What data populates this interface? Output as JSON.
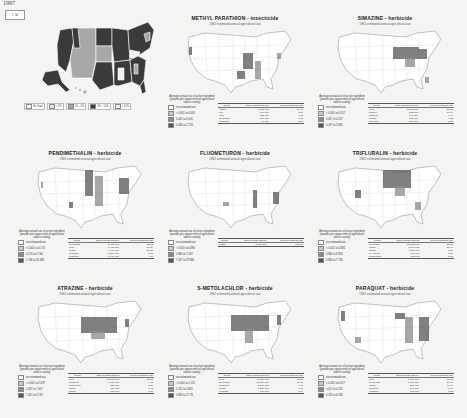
{
  "overview": {
    "year": "1997",
    "year_widget": "𝑓 ☑",
    "legend": [
      {
        "label": "No Data",
        "color": "#ffffff"
      },
      {
        "label": "< 1%",
        "color": "#e6e6e6"
      },
      {
        "label": "1% - 5%",
        "color": "#a8a8a8"
      },
      {
        "label": "5% - 10%",
        "color": "#3a3a3a"
      },
      {
        "label": "> 10%",
        "color": "#f0f0f0"
      }
    ]
  },
  "panels": [
    {
      "title": "METHYL PARATHION - insecticide",
      "subtitle": "1992 estimated annual agricultural use",
      "legend_title": "Average annual use of active ingredient (pounds per square mile of agricultural land in county)",
      "legend_items": [
        "no estimated use",
        "< 0.001 to 0.005",
        "0.005 to 0.056",
        "0.056 to 2.718"
      ],
      "table_headers": [
        "Crops",
        "Total pounds applied",
        "Percent national use"
      ],
      "table_rows": [
        [
          "cotton",
          "1,706,000",
          "69.90"
        ],
        [
          "rice",
          "197,000",
          "8.07"
        ],
        [
          "corn",
          "152,000",
          "6.23"
        ],
        [
          "soybeans",
          "124,000",
          "5.08"
        ],
        [
          "sorghum",
          "93,000",
          "3.81"
        ]
      ]
    },
    {
      "title": "SIMAZINE - herbicide",
      "subtitle": "1992 estimated annual agricultural use",
      "legend_title": "Average annual use of active ingredient (pounds per square mile of agricultural land in county)",
      "legend_items": [
        "no estimated use",
        "< 0.001 to 0.057",
        "0.057 to 0.197",
        "0.197 to 3.985"
      ],
      "table_headers": [
        "Crops",
        "Total pounds applied",
        "Percent national use"
      ],
      "table_rows": [
        [
          "corn",
          "2,650,000",
          "56.88"
        ],
        [
          "grapes",
          "512,000",
          "10.99"
        ],
        [
          "oranges",
          "440,000",
          "9.44"
        ],
        [
          "apples",
          "178,000",
          "3.82"
        ],
        [
          "almonds",
          "121,000",
          "2.60"
        ]
      ]
    },
    {
      "title": "PENDIMETHALIN - herbicide",
      "subtitle": "1992 estimated annual agricultural use",
      "legend_title": "Average annual use of active ingredient (pounds per square mile of agricultural land in county)",
      "legend_items": [
        "no estimated use",
        "< 0.001 to 0.174",
        "0.174 to 2.746",
        "2.746 to 32.488"
      ],
      "table_headers": [
        "Crops",
        "Total pounds applied",
        "Percent national use"
      ],
      "table_rows": [
        [
          "soybeans",
          "8,027,000",
          "32.05"
        ],
        [
          "corn",
          "7,912,000",
          "31.59"
        ],
        [
          "cotton",
          "4,474,000",
          "17.86"
        ],
        [
          "sorghum",
          "1,256,000",
          "5.02"
        ],
        [
          "peanuts",
          "1,040,000",
          "4.15"
        ]
      ]
    },
    {
      "title": "FLUOMETURON - herbicide",
      "subtitle": "1992 estimated annual agricultural use",
      "legend_title": "Average annual use of active ingredient (pounds per square mile of agricultural land in county)",
      "legend_items": [
        "no estimated use",
        "< 0.001 to 0.880",
        "0.880 to 7.187",
        "7.187 to 37.880"
      ],
      "table_headers": [
        "Crops",
        "Total pounds applied",
        "Percent national use"
      ],
      "table_rows": [
        [
          "cotton",
          "5,392,000",
          "100.00"
        ]
      ]
    },
    {
      "title": "TRIFLURALIN - herbicide",
      "subtitle": "1992 estimated annual agricultural use",
      "legend_title": "Average annual use of active ingredient (pounds per square mile of agricultural land in county)",
      "legend_items": [
        "no estimated use",
        "< 0.001 to 0.884",
        "0.884 to 3.856",
        "3.856 to 7.736"
      ],
      "table_headers": [
        "Crops",
        "Total pounds applied",
        "Percent national use"
      ],
      "table_rows": [
        [
          "soybeans",
          "13,802,000",
          "52.51"
        ],
        [
          "cotton",
          "5,641,000",
          "21.46"
        ],
        [
          "wheat",
          "1,456,000",
          "5.54"
        ],
        [
          "dry beans",
          "760,000",
          "2.89"
        ],
        [
          "sunflowers",
          "612,000",
          "2.33"
        ]
      ]
    },
    {
      "title": "ATRAZINE - herbicide",
      "subtitle": "1992 estimated annual agricultural use",
      "legend_title": "Average annual use of active ingredient (pounds per square mile of agricultural land in county)",
      "legend_items": [
        "no estimated use",
        "< 0.001 to 2.037",
        "2.037 to 7.407",
        "7.407 to 17.95"
      ],
      "table_headers": [
        "Crops",
        "Total pounds applied",
        "Percent national use"
      ],
      "table_rows": [
        [
          "corn",
          "57,000,000",
          "88.05"
        ],
        [
          "sorghum",
          "6,100,000",
          "9.42"
        ],
        [
          "sugarcane",
          "825,000",
          "1.27"
        ],
        [
          "fallow",
          "311,000",
          "0.48"
        ],
        [
          "wheat",
          "180,000",
          "0.28"
        ]
      ]
    },
    {
      "title": "S-METOLACHLOR - herbicide",
      "subtitle": "1992 estimated annual agricultural use",
      "legend_title": "Average annual use of active ingredient (pounds per square mile of agricultural land in county)",
      "legend_items": [
        "no estimated use",
        "< 0.001 to 1.152",
        "1.152 to 5.859",
        "5.859 to 17.78"
      ],
      "table_headers": [
        "Crops",
        "Total pounds applied",
        "Percent national use"
      ],
      "table_rows": [
        [
          "corn",
          "46,000,000",
          "72.21"
        ],
        [
          "soybeans",
          "12,200,000",
          "19.15"
        ],
        [
          "sorghum",
          "2,800,000",
          "4.40"
        ],
        [
          "cotton",
          "1,230,000",
          "1.93"
        ],
        [
          "peanuts",
          "980,000",
          "1.54"
        ]
      ]
    },
    {
      "title": "PARAQUAT - herbicide",
      "subtitle": "1992 estimated annual agricultural use",
      "legend_title": "Average annual use of active ingredient (pounds per square mile of agricultural land in county)",
      "legend_items": [
        "no estimated use",
        "< 0.001 to 0.017",
        "0.017 to 0.135",
        "0.135 to 6.296"
      ],
      "table_headers": [
        "Crops",
        "Total pounds applied",
        "Percent national use"
      ],
      "table_rows": [
        [
          "corn",
          "1,566,000",
          "33.38"
        ],
        [
          "soybeans",
          "1,102,000",
          "23.49"
        ],
        [
          "cotton",
          "561,000",
          "11.96"
        ],
        [
          "peanuts",
          "314,000",
          "6.69"
        ],
        [
          "potatoes",
          "245,000",
          "5.22"
        ]
      ]
    }
  ],
  "colors": {
    "map_outline": "#9a9a9a",
    "map_fill": "#ffffff",
    "use_dark": "#555555",
    "use_mid": "#8a8a8a",
    "use_light": "#c8c8c8",
    "state_dark": "#3a3a3a",
    "state_mid": "#a8a8a8"
  }
}
